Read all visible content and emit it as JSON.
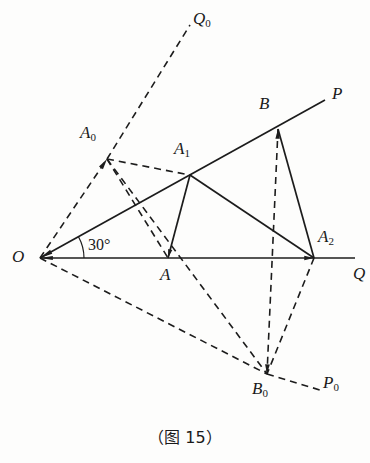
{
  "figure": {
    "caption": "（图 15）",
    "angle_label": "30°",
    "stroke_color": "#1c1c1c",
    "background_color": "#fdfdfc",
    "points": {
      "O": {
        "label": "O",
        "sub": "",
        "x": 40,
        "y": 258,
        "lx": 12,
        "ly": 248
      },
      "A": {
        "label": "A",
        "sub": "",
        "x": 168,
        "y": 258,
        "lx": 160,
        "ly": 266
      },
      "A0": {
        "label": "A",
        "sub": "0",
        "x": 107,
        "y": 159,
        "lx": 80,
        "ly": 124
      },
      "A1": {
        "label": "A",
        "sub": "1",
        "x": 190,
        "y": 175,
        "lx": 174,
        "ly": 140
      },
      "A2": {
        "label": "A",
        "sub": "2",
        "x": 314,
        "y": 258,
        "lx": 318,
        "ly": 228
      },
      "B": {
        "label": "B",
        "sub": "",
        "x": 278,
        "y": 129,
        "lx": 259,
        "ly": 95
      },
      "B0": {
        "label": "B",
        "sub": "0",
        "x": 267,
        "y": 374,
        "lx": 252,
        "ly": 380
      },
      "P": {
        "label": "P",
        "sub": "",
        "x": 325,
        "y": 100,
        "lx": 332,
        "ly": 85
      },
      "Q": {
        "label": "Q",
        "sub": "",
        "x": 355,
        "y": 258,
        "lx": 353,
        "ly": 265
      },
      "P0": {
        "label": "P",
        "sub": "0",
        "x": 320,
        "y": 390,
        "lx": 323,
        "ly": 374
      },
      "Q0": {
        "label": "Q",
        "sub": "0",
        "x": 190,
        "y": 25,
        "lx": 193,
        "ly": 10
      }
    },
    "solid_edges": [
      {
        "name": "ray-OQ",
        "from": "O",
        "to": "Q"
      },
      {
        "name": "ray-OP",
        "from": "O",
        "to": "P"
      },
      {
        "name": "seg-A1-A",
        "from": "A1",
        "to": "A"
      },
      {
        "name": "seg-A1-A2",
        "from": "A1",
        "to": "A2"
      },
      {
        "name": "seg-B-A2",
        "from": "B",
        "to": "A2"
      }
    ],
    "dashed_edges": [
      {
        "name": "seg-O-A0",
        "from": "O",
        "to": "A0"
      },
      {
        "name": "seg-A0-Q0",
        "from": "A0",
        "to": "Q0"
      },
      {
        "name": "seg-A0-A1",
        "from": "A0",
        "to": "A1"
      },
      {
        "name": "seg-A0-A",
        "from": "A0",
        "to": "A"
      },
      {
        "name": "seg-A0-B0",
        "from": "A0",
        "to": "B0"
      },
      {
        "name": "seg-O-B0",
        "from": "O",
        "to": "B0"
      },
      {
        "name": "seg-B-B0",
        "from": "B",
        "to": "B0"
      },
      {
        "name": "seg-A2-B0",
        "from": "A2",
        "to": "B0"
      },
      {
        "name": "seg-B0-P0",
        "from": "B0",
        "to": "P0"
      }
    ],
    "angle_arc": {
      "name": "angle-30-arc",
      "cx": 40,
      "cy": 258,
      "r": 44,
      "label_x": 88,
      "label_y": 236
    },
    "arrowheads": [
      {
        "name": "arrow-at-O-from-OP"
      },
      {
        "name": "arrow-at-O-from-OQ"
      },
      {
        "name": "arrow-at-A0"
      },
      {
        "name": "arrow-at-A2"
      },
      {
        "name": "arrow-at-B"
      },
      {
        "name": "arrow-at-B0"
      },
      {
        "name": "arrow-at-A"
      }
    ]
  }
}
